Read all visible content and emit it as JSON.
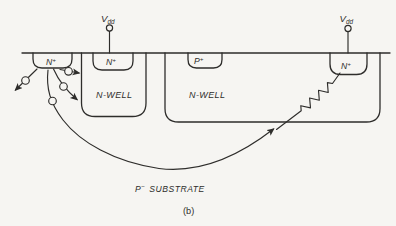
{
  "colors": {
    "bg": "#f6f5f2",
    "ink": "#2e2d2b"
  },
  "figure": {
    "caption": "(b)",
    "terminals": {
      "vdd_left": {
        "base": "V",
        "sub": "dd"
      },
      "vdd_right": {
        "base": "V",
        "sub": "dd"
      }
    },
    "labels": {
      "n_plus_left": {
        "base": "N",
        "sup": "+"
      },
      "n_plus_guard": {
        "base": "N",
        "sup": "+"
      },
      "p_plus": {
        "base": "P",
        "sup": "+"
      },
      "n_plus_right": {
        "base": "N",
        "sup": "+"
      },
      "n_well_left": "N-WELL",
      "n_well_right": "N-WELL",
      "substrate": {
        "base": "P",
        "sup": "−",
        "rest": "SUBSTRATE"
      }
    }
  }
}
